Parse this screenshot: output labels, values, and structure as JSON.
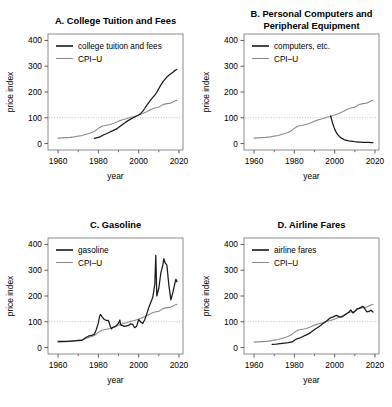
{
  "figure": {
    "background": "#ffffff",
    "series_color_data": "#1a1a1a",
    "series_color_cpi": "#8c8c8c",
    "reference_line_color": "#b0b0b0",
    "frame_color": "#808080"
  },
  "axes": {
    "xlabel": "year",
    "ylabel": "price index",
    "xticks": [
      1960,
      1980,
      2000,
      2020
    ],
    "yticks": [
      0,
      100,
      200,
      300,
      400
    ],
    "xlim": [
      1955,
      2022
    ],
    "ylim": [
      -25,
      425
    ],
    "reference_y": 100,
    "grid": false
  },
  "panels": [
    {
      "id": "A",
      "title": "A. College Tuition and Fees",
      "title_lines": [
        "A. College Tuition and Fees"
      ],
      "legend": [
        "college tuition and fees",
        "CPI–U"
      ]
    },
    {
      "id": "B",
      "title": "B. Personal Computers and Peripheral Equipment",
      "title_lines": [
        "B. Personal Computers and",
        "Peripheral Equipment"
      ],
      "legend": [
        "computers, etc.",
        "CPI–U"
      ]
    },
    {
      "id": "C",
      "title": "C. Gasoline",
      "title_lines": [
        "C. Gasoline"
      ],
      "legend": [
        "gasoline",
        "CPI–U"
      ]
    },
    {
      "id": "D",
      "title": "D. Airline Fares",
      "title_lines": [
        "D. Airline Fares"
      ],
      "legend": [
        "airline fares",
        "CPI–U"
      ]
    }
  ],
  "chart_data": [
    {
      "type": "line",
      "panel": "A",
      "title": "A. College Tuition and Fees",
      "xlabel": "year",
      "ylabel": "price index",
      "xlim": [
        1955,
        2022
      ],
      "ylim": [
        -25,
        425
      ],
      "grid": false,
      "legend_position": "top-left",
      "reference_line": 100,
      "series": [
        {
          "name": "college tuition and fees",
          "color": "#1a1a1a",
          "x": [
            1978,
            1979,
            1980,
            1981,
            1982,
            1983,
            1984,
            1985,
            1986,
            1987,
            1988,
            1989,
            1990,
            1991,
            1992,
            1993,
            1994,
            1995,
            1996,
            1997,
            1998,
            1999,
            2000,
            2001,
            2002,
            2003,
            2004,
            2005,
            2006,
            2007,
            2008,
            2009,
            2010,
            2011,
            2012,
            2013,
            2014,
            2015,
            2016,
            2017,
            2018,
            2019
          ],
          "y": [
            20,
            22,
            24,
            27,
            31,
            35,
            38,
            42,
            46,
            49,
            53,
            57,
            62,
            68,
            74,
            80,
            85,
            90,
            95,
            99,
            103,
            107,
            111,
            117,
            125,
            136,
            148,
            159,
            169,
            179,
            188,
            199,
            213,
            227,
            239,
            249,
            258,
            265,
            271,
            277,
            283,
            288
          ]
        },
        {
          "name": "CPI–U",
          "color": "#8c8c8c",
          "x": [
            1960,
            1962,
            1964,
            1966,
            1968,
            1970,
            1972,
            1974,
            1976,
            1978,
            1980,
            1982,
            1984,
            1986,
            1988,
            1990,
            1992,
            1994,
            1996,
            1998,
            2000,
            2002,
            2004,
            2006,
            2008,
            2010,
            2012,
            2014,
            2016,
            2018,
            2019
          ],
          "y": [
            21,
            22,
            23,
            24,
            26,
            29,
            31,
            36,
            41,
            47,
            59,
            68,
            71,
            74,
            80,
            87,
            92,
            96,
            102,
            105,
            111,
            117,
            123,
            132,
            138,
            141,
            151,
            155,
            157,
            165,
            168
          ]
        }
      ]
    },
    {
      "type": "line",
      "panel": "B",
      "title": "B. Personal Computers and Peripheral Equipment",
      "xlabel": "year",
      "ylabel": "price index",
      "xlim": [
        1955,
        2022
      ],
      "ylim": [
        -25,
        425
      ],
      "grid": false,
      "legend_position": "top-left",
      "reference_line": 100,
      "series": [
        {
          "name": "computers, etc.",
          "color": "#1a1a1a",
          "x": [
            1998,
            1999,
            2000,
            2001,
            2002,
            2003,
            2004,
            2005,
            2006,
            2007,
            2008,
            2009,
            2010,
            2011,
            2012,
            2013,
            2014,
            2015,
            2016,
            2017,
            2018,
            2019
          ],
          "y": [
            107,
            78,
            56,
            40,
            30,
            23,
            18,
            14,
            12,
            10,
            9,
            8,
            7,
            6.5,
            6,
            5.5,
            5,
            4.7,
            4.4,
            4.2,
            4,
            3.8
          ]
        },
        {
          "name": "CPI–U",
          "color": "#8c8c8c",
          "x": [
            1960,
            1962,
            1964,
            1966,
            1968,
            1970,
            1972,
            1974,
            1976,
            1978,
            1980,
            1982,
            1984,
            1986,
            1988,
            1990,
            1992,
            1994,
            1996,
            1998,
            2000,
            2002,
            2004,
            2006,
            2008,
            2010,
            2012,
            2014,
            2016,
            2018,
            2019
          ],
          "y": [
            21,
            22,
            23,
            24,
            26,
            29,
            31,
            36,
            41,
            47,
            59,
            68,
            71,
            74,
            80,
            87,
            92,
            96,
            102,
            105,
            111,
            117,
            123,
            132,
            138,
            141,
            151,
            155,
            157,
            165,
            168
          ]
        }
      ]
    },
    {
      "type": "line",
      "panel": "C",
      "title": "C. Gasoline",
      "xlabel": "year",
      "ylabel": "price index",
      "xlim": [
        1955,
        2022
      ],
      "ylim": [
        -25,
        425
      ],
      "grid": false,
      "legend_position": "top-left",
      "reference_line": 100,
      "series": [
        {
          "name": "gasoline",
          "color": "#1a1a1a",
          "x": [
            1960,
            1962,
            1964,
            1966,
            1968,
            1970,
            1972,
            1974,
            1975,
            1976,
            1977,
            1978,
            1979,
            1980,
            1980.5,
            1981,
            1981.5,
            1982,
            1983,
            1984,
            1985,
            1986,
            1986.5,
            1987,
            1988,
            1989,
            1990,
            1990.7,
            1991,
            1992,
            1993,
            1994,
            1995,
            1996,
            1997,
            1998,
            1999,
            2000,
            2001,
            2002,
            2003,
            2004,
            2005,
            2006,
            2007,
            2008,
            2008.5,
            2009,
            2010,
            2011,
            2012,
            2012.5,
            2013,
            2014,
            2015,
            2016,
            2017,
            2018,
            2018.5,
            2019
          ],
          "y": [
            24,
            24,
            24,
            25,
            26,
            27,
            28,
            40,
            44,
            46,
            48,
            52,
            70,
            96,
            118,
            128,
            124,
            117,
            109,
            105,
            105,
            80,
            72,
            78,
            80,
            86,
            95,
            107,
            88,
            85,
            82,
            84,
            86,
            92,
            90,
            77,
            83,
            108,
            100,
            93,
            108,
            130,
            155,
            175,
            195,
            245,
            358,
            200,
            230,
            290,
            320,
            345,
            330,
            320,
            240,
            185,
            215,
            250,
            265,
            255
          ]
        },
        {
          "name": "CPI–U",
          "color": "#8c8c8c",
          "x": [
            1960,
            1962,
            1964,
            1966,
            1968,
            1970,
            1972,
            1974,
            1976,
            1978,
            1980,
            1982,
            1984,
            1986,
            1988,
            1990,
            1992,
            1994,
            1996,
            1998,
            2000,
            2002,
            2004,
            2006,
            2008,
            2010,
            2012,
            2014,
            2016,
            2018,
            2019
          ],
          "y": [
            21,
            22,
            23,
            24,
            26,
            29,
            31,
            36,
            41,
            47,
            59,
            68,
            71,
            74,
            80,
            87,
            92,
            96,
            102,
            105,
            111,
            117,
            123,
            132,
            138,
            141,
            151,
            155,
            157,
            165,
            168
          ]
        }
      ]
    },
    {
      "type": "line",
      "panel": "D",
      "title": "D. Airline Fares",
      "xlabel": "year",
      "ylabel": "price index",
      "xlim": [
        1955,
        2022
      ],
      "ylim": [
        -25,
        425
      ],
      "grid": false,
      "legend_position": "top-left",
      "reference_line": 100,
      "series": [
        {
          "name": "airline fares",
          "color": "#1a1a1a",
          "x": [
            1969,
            1971,
            1973,
            1975,
            1977,
            1979,
            1980,
            1981,
            1982,
            1983,
            1984,
            1985,
            1986,
            1987,
            1988,
            1989,
            1990,
            1991,
            1992,
            1993,
            1994,
            1995,
            1996,
            1997,
            1998,
            1999,
            2000,
            2001,
            2002,
            2003,
            2004,
            2005,
            2006,
            2007,
            2008,
            2009,
            2010,
            2011,
            2012,
            2013,
            2014,
            2015,
            2016,
            2017,
            2018,
            2019
          ],
          "y": [
            12,
            13,
            15,
            17,
            19,
            22,
            28,
            33,
            36,
            38,
            42,
            46,
            49,
            53,
            58,
            64,
            70,
            75,
            80,
            86,
            92,
            97,
            103,
            110,
            116,
            118,
            122,
            125,
            120,
            118,
            120,
            126,
            132,
            137,
            146,
            134,
            140,
            150,
            152,
            156,
            160,
            150,
            138,
            140,
            145,
            138
          ]
        },
        {
          "name": "CPI–U",
          "color": "#8c8c8c",
          "x": [
            1960,
            1962,
            1964,
            1966,
            1968,
            1970,
            1972,
            1974,
            1976,
            1978,
            1980,
            1982,
            1984,
            1986,
            1988,
            1990,
            1992,
            1994,
            1996,
            1998,
            2000,
            2002,
            2004,
            2006,
            2008,
            2010,
            2012,
            2014,
            2016,
            2018,
            2019
          ],
          "y": [
            21,
            22,
            23,
            24,
            26,
            29,
            31,
            36,
            41,
            47,
            59,
            68,
            71,
            74,
            80,
            87,
            92,
            96,
            102,
            105,
            111,
            117,
            123,
            132,
            138,
            141,
            151,
            155,
            157,
            165,
            168
          ]
        }
      ]
    }
  ]
}
